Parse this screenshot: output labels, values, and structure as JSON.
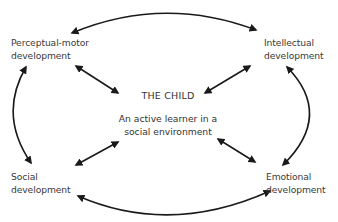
{
  "diagram": {
    "center": {
      "title": "THE CHILD",
      "subtitle_line1": "An active learner in a",
      "subtitle_line2": "social environment"
    },
    "nodes": [
      {
        "id": "perceptual-motor",
        "line1": "Perceptual-motor",
        "line2": "development",
        "position": "top-left"
      },
      {
        "id": "intellectual",
        "line1": "Intellectual",
        "line2": "development",
        "position": "top-right"
      },
      {
        "id": "social",
        "line1": "Social",
        "line2": "development",
        "position": "bottom-left"
      },
      {
        "id": "emotional",
        "line1": "Emotional",
        "line2": "development",
        "position": "bottom-right"
      }
    ],
    "connections": [
      {
        "from": "perceptual-motor",
        "to": "intellectual",
        "type": "curved-bidirectional"
      },
      {
        "from": "social",
        "to": "emotional",
        "type": "curved-bidirectional"
      },
      {
        "from": "perceptual-motor",
        "to": "social",
        "type": "curved-bidirectional"
      },
      {
        "from": "intellectual",
        "to": "emotional",
        "type": "curved-bidirectional"
      },
      {
        "from": "perceptual-motor",
        "to": "center",
        "type": "straight-bidirectional"
      },
      {
        "from": "intellectual",
        "to": "center",
        "type": "straight-bidirectional"
      },
      {
        "from": "social",
        "to": "center",
        "type": "straight-bidirectional"
      },
      {
        "from": "emotional",
        "to": "center",
        "type": "straight-bidirectional"
      }
    ],
    "colors": {
      "arrow": "#1a1a1a",
      "text": "#3a3a3a",
      "background": "#ffffff"
    }
  }
}
